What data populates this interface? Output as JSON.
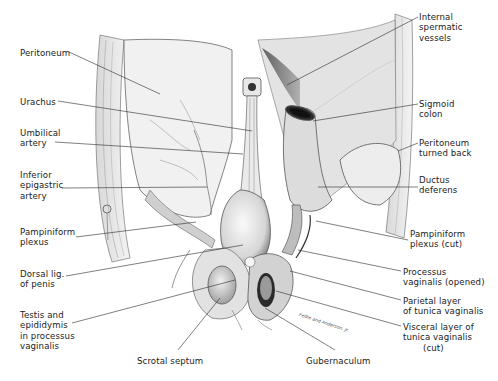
{
  "figure": {
    "signature": "Fetke and Anderson, Jr.",
    "labels_left": [
      {
        "id": "peritoneum",
        "lines": [
          "Peritoneum"
        ],
        "x": 20,
        "y": 48,
        "line_to": [
          160,
          94
        ]
      },
      {
        "id": "urachus",
        "lines": [
          "Urachus"
        ],
        "x": 20,
        "y": 97,
        "line_to": [
          252,
          131
        ]
      },
      {
        "id": "umbilical-artery",
        "lines": [
          "Umbilical",
          "artery"
        ],
        "x": 20,
        "y": 128,
        "line_to": [
          243,
          154
        ]
      },
      {
        "id": "inferior-epigastric-artery",
        "lines": [
          "Inferior",
          "epigastric",
          "artery"
        ],
        "x": 20,
        "y": 170,
        "line_to": [
          207,
          187
        ]
      },
      {
        "id": "pampiniform-plexus",
        "lines": [
          "Pampiniform",
          "plexus"
        ],
        "x": 20,
        "y": 227,
        "line_to": [
          196,
          222
        ]
      },
      {
        "id": "dorsal-lig-of-penis",
        "lines": [
          "Dorsal lig.",
          "of penis"
        ],
        "x": 20,
        "y": 269,
        "line_to": [
          243,
          245
        ]
      },
      {
        "id": "testis-and-epididymis",
        "lines": [
          "Testis and",
          "epididymis",
          "in processus",
          "vaginalis"
        ],
        "x": 20,
        "y": 310,
        "line_to": [
          235,
          280
        ]
      }
    ],
    "labels_right": [
      {
        "id": "internal-spermatic-vessels",
        "lines": [
          "Internal",
          "spermatic",
          "vessels"
        ],
        "x": 419,
        "y": 12,
        "line_to": [
          287,
          85
        ]
      },
      {
        "id": "sigmoid-colon",
        "lines": [
          "Sigmoid",
          "colon"
        ],
        "x": 419,
        "y": 99,
        "line_to": [
          313,
          121
        ]
      },
      {
        "id": "peritoneum-turned-back",
        "lines": [
          "Peritoneum",
          "turned back"
        ],
        "x": 419,
        "y": 138,
        "line_to": [
          398,
          151
        ]
      },
      {
        "id": "ductus-deferens",
        "lines": [
          "Ductus",
          "deferens"
        ],
        "x": 419,
        "y": 175,
        "line_to": [
          318,
          187
        ]
      },
      {
        "id": "pampiniform-plexus-cut",
        "lines": [
          "Pampiniform",
          "plexus (cut)"
        ],
        "x": 410,
        "y": 229,
        "line_to": [
          316,
          221
        ]
      },
      {
        "id": "processus-vaginalis-opened",
        "lines": [
          "Processus",
          "vaginalis (opened)"
        ],
        "x": 403,
        "y": 267,
        "line_to": [
          298,
          250
        ]
      },
      {
        "id": "parietal-layer-tunica-vaginalis",
        "lines": [
          "Parietal layer",
          "of tunica vaginalis"
        ],
        "x": 403,
        "y": 296,
        "line_to": [
          290,
          271
        ]
      },
      {
        "id": "visceral-layer-tunica-vaginalis",
        "lines": [
          "Visceral layer of",
          "tunica vaginalis",
          "(cut)"
        ],
        "x": 403,
        "y": 322,
        "line_to": [
          276,
          291
        ]
      }
    ],
    "labels_bottom": [
      {
        "id": "scrotal-septum",
        "lines": [
          "Scrotal septum"
        ],
        "x": 137,
        "y": 356,
        "line_to": [
          220,
          298
        ]
      },
      {
        "id": "gubernaculum",
        "lines": [
          "Gubernaculum"
        ],
        "x": 306,
        "y": 356,
        "line_to": [
          265,
          308
        ]
      }
    ]
  }
}
